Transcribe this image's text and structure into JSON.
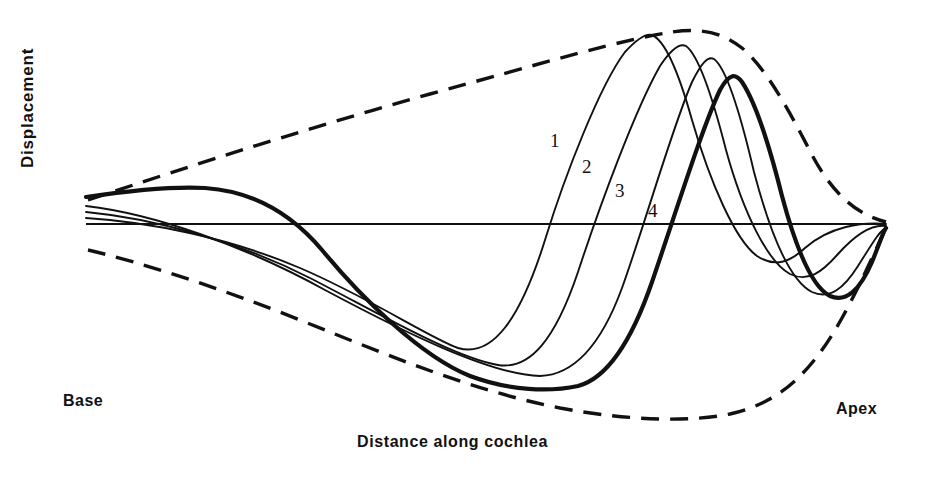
{
  "figure": {
    "background_color": "#ffffff",
    "ink_color": "#111111"
  },
  "axes": {
    "y_label": "Displacement",
    "x_label": "Distance along cochlea",
    "left_end_label": "Base",
    "right_end_label": "Apex",
    "baseline": {
      "x1": 86,
      "x2": 886,
      "y": 224,
      "stroke_width": 2.2
    }
  },
  "curve_labels": [
    {
      "text": "1",
      "x": 550,
      "y": 130
    },
    {
      "text": "2",
      "x": 582,
      "y": 156
    },
    {
      "text": "3",
      "x": 615,
      "y": 180
    },
    {
      "text": "4",
      "x": 648,
      "y": 200
    }
  ],
  "chart_data": {
    "type": "line",
    "xlabel": "Distance along cochlea",
    "ylabel": "Displacement",
    "xlim": [
      86,
      886
    ],
    "ylim": [
      30,
      425
    ],
    "grid": false,
    "legend": "inline curve numbers 1-4",
    "axis_orientation": "baseline is zero displacement at y=224; up is positive",
    "x_tick_labels": [
      "Base",
      "Apex"
    ],
    "y_tick_labels": [],
    "annotations": [
      "1",
      "2",
      "3",
      "4"
    ],
    "series": [
      {
        "name": "1",
        "role": "instantaneous-waveform",
        "stroke_width": 1.9,
        "dash": "none",
        "zero_crossing_rising_x": 527,
        "peak": {
          "x": 650,
          "y": 35
        },
        "trough": {
          "x": 455,
          "y": 348
        },
        "path": "M 86,218 C 150,222 230,238 300,268 C 370,298 430,338 458,348 C 492,358 520,320 545,240 C 565,175 600,85 625,52 C 638,38 646,33 652,35 C 664,40 678,70 692,120 C 710,182 735,240 757,256 C 775,268 790,262 805,248 C 830,226 862,222 886,224"
      },
      {
        "name": "2",
        "role": "instantaneous-waveform",
        "stroke_width": 1.9,
        "dash": "none",
        "zero_crossing_rising_x": 570,
        "peak": {
          "x": 678,
          "y": 45
        },
        "trough": {
          "x": 495,
          "y": 365
        },
        "path": "M 86,212 C 150,218 235,240 310,278 C 380,314 455,358 498,365 C 530,370 555,340 578,272 C 600,205 635,110 660,66 C 672,48 680,43 686,46 C 698,55 712,95 726,150 C 744,215 768,262 790,274 C 808,283 822,272 838,254 C 856,234 872,224 886,226"
      },
      {
        "name": "3",
        "role": "instantaneous-waveform",
        "stroke_width": 1.9,
        "dash": "none",
        "zero_crossing_rising_x": 614,
        "peak": {
          "x": 702,
          "y": 58
        },
        "trough": {
          "x": 540,
          "y": 376
        },
        "path": "M 86,206 C 155,214 245,246 325,290 C 400,330 490,375 540,376 C 572,375 600,348 622,288 C 645,224 672,128 692,82 C 702,62 708,56 714,59 C 726,68 740,112 754,172 C 772,240 792,282 812,292 C 830,300 844,288 858,266 C 872,244 880,230 886,228"
      },
      {
        "name": "4",
        "role": "instantaneous-waveform-bold-envelope-touching",
        "stroke_width": 4.2,
        "dash": "none",
        "zero_crossing_rising_x": 658,
        "peak": {
          "x": 726,
          "y": 78
        },
        "trough": {
          "x": 575,
          "y": 386
        },
        "path": "M 86,197 C 120,192 170,186 205,188 C 250,191 290,212 322,250 C 360,296 420,356 470,376 C 510,391 550,392 578,386 C 608,378 632,340 652,282 C 676,212 702,128 720,90 C 730,72 736,74 742,82 C 754,100 768,140 782,196 C 798,256 814,288 830,296 C 846,303 860,290 872,262 C 880,242 884,230 886,228"
      },
      {
        "name": "upper-envelope",
        "role": "envelope",
        "stroke_width": 3.4,
        "dash": "18 11",
        "peak": {
          "x": 700,
          "y": 32
        },
        "path": "M 88,200 C 160,176 300,130 430,94 C 540,64 620,40 672,32 C 700,28 722,32 742,48 C 766,68 790,112 812,155 C 836,200 862,216 886,222"
      },
      {
        "name": "lower-envelope",
        "role": "envelope",
        "stroke_width": 3.4,
        "dash": "18 11",
        "trough": {
          "x": 700,
          "y": 418
        },
        "path": "M 88,250 C 140,262 220,288 300,320 C 390,356 470,390 560,408 C 630,421 690,422 730,414 C 780,403 812,372 842,318 C 864,278 878,244 886,228"
      }
    ]
  }
}
